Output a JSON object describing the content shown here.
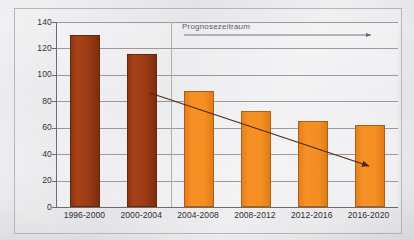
{
  "chart_data": {
    "type": "bar",
    "title": "",
    "subtitle": "",
    "xlabel": "",
    "ylabel": "in ha pro Tag",
    "ylim": [
      0,
      140
    ],
    "ytick_step": 20,
    "yticks": [
      "0",
      "20",
      "40",
      "60",
      "80",
      "100",
      "120",
      "140"
    ],
    "grid": true,
    "legend": false,
    "categories": [
      "1996-2000",
      "2000-2004",
      "2004-2008",
      "2008-2012",
      "2012-2016",
      "2016-2020"
    ],
    "values": [
      130,
      116,
      88,
      73,
      65,
      62
    ],
    "series": [
      {
        "name": "Flächenverbrauch in ha pro Tag",
        "values": [
          130,
          116,
          88,
          73,
          65,
          62
        ],
        "point_kinds": [
          "historical",
          "historical",
          "forecast",
          "forecast",
          "forecast",
          "forecast"
        ]
      }
    ],
    "annotations": [
      {
        "name": "forecast-period-label",
        "text": "Prognosezeitraum",
        "type": "arrow-right",
        "from_category": "2004-2008",
        "to_category": "2016-2020"
      },
      {
        "name": "trend-arrow",
        "text": "",
        "type": "declining-trend-arrow",
        "from_value": 88,
        "to_value": 40
      }
    ],
    "colors": {
      "historical_bar": "#9b3a14",
      "forecast_bar": "#f68f22",
      "bar_outline": "#6a4320",
      "forecast_divider": "#9cbd96",
      "gridline": "#8d8a91",
      "axis": "#6d6a70",
      "trend_arrow": "#4a2b18",
      "annotation_text": "#5d5b66",
      "tick_text": "#33313a",
      "background": "#e1dfe3"
    }
  },
  "axes": {
    "y_title": "in ha pro Tag",
    "y_ticks": [
      {
        "label": "140",
        "value": 140
      },
      {
        "label": "120",
        "value": 120
      },
      {
        "label": "100",
        "value": 100
      },
      {
        "label": "80",
        "value": 80
      },
      {
        "label": "60",
        "value": 60
      },
      {
        "label": "40",
        "value": 40
      },
      {
        "label": "20",
        "value": 20
      },
      {
        "label": "0",
        "value": 0
      }
    ],
    "x_ticks": [
      {
        "label": "1996-2000"
      },
      {
        "label": "2000-2004"
      },
      {
        "label": "2004-2008"
      },
      {
        "label": "2008-2012"
      },
      {
        "label": "2012-2016"
      },
      {
        "label": "2016-2020"
      }
    ]
  },
  "annotation": {
    "forecast_label": "Prognosezeitraum"
  }
}
